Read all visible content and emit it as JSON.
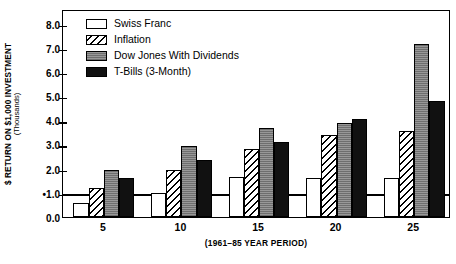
{
  "chart_data": {
    "type": "bar",
    "title": "",
    "xlabel": "(1961–85 YEAR PERIOD)",
    "ylabel": "$ RETURN ON $1,000 INVESTMENT",
    "ylabel_sub": "(Thousands)",
    "categories": [
      "5",
      "10",
      "15",
      "20",
      "25"
    ],
    "ylim": [
      0.0,
      8.6
    ],
    "yticks": [
      "0.0",
      "1.0",
      "2.0",
      "3.0",
      "4.0",
      "5.0",
      "6.0",
      "7.0",
      "8.0"
    ],
    "ytick_values": [
      0.0,
      1.0,
      2.0,
      3.0,
      4.0,
      5.0,
      6.0,
      7.0,
      8.0
    ],
    "ytick_marker": "•",
    "ytick_marker_value": 1.0,
    "reference_line": 1.0,
    "grid": false,
    "legend_position": "top-left",
    "series": [
      {
        "name": "Swiss Franc",
        "fill": "white",
        "values": [
          0.6,
          1.0,
          1.65,
          1.6,
          1.6
        ]
      },
      {
        "name": "Inflation",
        "fill": "diagonal-hatch",
        "values": [
          1.2,
          1.95,
          2.8,
          3.4,
          3.55
        ]
      },
      {
        "name": "Dow Jones With Dividends",
        "fill": "gray-stipple",
        "values": [
          1.95,
          2.95,
          3.7,
          3.9,
          7.15
        ]
      },
      {
        "name": "T-Bills (3-Month)",
        "fill": "black",
        "values": [
          1.6,
          2.35,
          3.1,
          4.05,
          4.8
        ]
      }
    ]
  },
  "legend": {
    "items": [
      {
        "label": "Swiss Franc"
      },
      {
        "label": "Inflation"
      },
      {
        "label": "Dow Jones With Dividends"
      },
      {
        "label": "T-Bills (3-Month)"
      }
    ]
  }
}
